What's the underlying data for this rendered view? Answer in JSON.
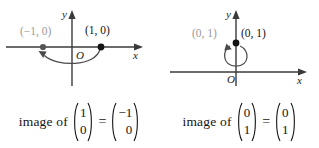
{
  "figure": {
    "panels": [
      {
        "id": "panel-left",
        "diagram": {
          "x_axis_label": "x",
          "y_axis_label": "y",
          "origin_label": "O",
          "source_point_label": "(1, 0)",
          "image_point_label": "(−1, 0)",
          "arrow_description": "curved-arrow-from-1-0-to-minus-1-0"
        },
        "equation": {
          "lead_text": "image of",
          "operator": "=",
          "input_vector": [
            "1",
            "0"
          ],
          "output_vector": [
            "−1",
            "0"
          ]
        }
      },
      {
        "id": "panel-right",
        "diagram": {
          "x_axis_label": "x",
          "y_axis_label": "y",
          "origin_label": "O",
          "source_point_label": "(0, 1)",
          "image_point_label": "(0, 1)",
          "arrow_description": "loop-arrow-at-0-1"
        },
        "equation": {
          "lead_text": "image of",
          "operator": "=",
          "input_vector": [
            "0",
            "1"
          ],
          "output_vector": [
            "0",
            "1"
          ]
        }
      }
    ],
    "colors": {
      "ink": "#141414",
      "dim_ink": "#9a9a9a",
      "axis": "#3a3a3a",
      "background": "#ffffff"
    }
  }
}
